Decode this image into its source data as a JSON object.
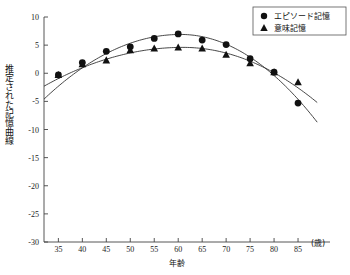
{
  "chart_data": {
    "type": "scatter",
    "title": "",
    "xlabel": "年齢",
    "ylabel": "推定された記憶曲線",
    "x_unit_label": "(歳)",
    "xlim": [
      32,
      90
    ],
    "ylim": [
      -30,
      10
    ],
    "xticks": [
      35,
      40,
      45,
      50,
      55,
      60,
      65,
      70,
      75,
      80,
      85
    ],
    "xtick_labels": [
      "35",
      "40",
      "45",
      "50",
      "55",
      "60",
      "65",
      "70",
      "75",
      "80",
      "85"
    ],
    "yticks": [
      10,
      5,
      0,
      -5,
      -10,
      -15,
      -20,
      -25,
      -30
    ],
    "ytick_labels": [
      "10",
      "5",
      "0",
      "-5",
      "-10",
      "-15",
      "-20",
      "-25",
      "-30"
    ],
    "grid": false,
    "legend_position": "top-right",
    "series": [
      {
        "name": "エピソード記憶",
        "marker": "circle",
        "color": "#111111",
        "x": [
          35,
          40,
          45,
          50,
          55,
          60,
          65,
          70,
          75,
          80,
          85
        ],
        "values": [
          -0.3,
          1.9,
          3.9,
          4.7,
          6.2,
          7.0,
          5.9,
          5.1,
          2.6,
          0.2,
          -5.3
        ],
        "fit_curve": {
          "type": "quadratic",
          "x_start": 32,
          "x_end": 89,
          "vertex_x": 60.5,
          "vertex_y": 6.9,
          "y_start": -4.6,
          "y_end": -8.7
        }
      },
      {
        "name": "意味記憶",
        "marker": "triangle",
        "color": "#111111",
        "x": [
          35,
          40,
          45,
          50,
          55,
          60,
          65,
          70,
          75,
          80,
          85
        ],
        "values": [
          -0.3,
          1.6,
          2.3,
          4.1,
          4.4,
          4.6,
          4.4,
          3.3,
          1.8,
          0.2,
          -1.6
        ],
        "fit_curve": {
          "type": "quadratic",
          "x_start": 32,
          "x_end": 89,
          "vertex_x": 61.0,
          "vertex_y": 4.6,
          "y_start": -2.3,
          "y_end": -5.2
        }
      }
    ]
  },
  "legend": {
    "entries": [
      {
        "label": "エピソード記憶",
        "marker": "circle"
      },
      {
        "label": "意味記憶",
        "marker": "triangle"
      }
    ]
  }
}
